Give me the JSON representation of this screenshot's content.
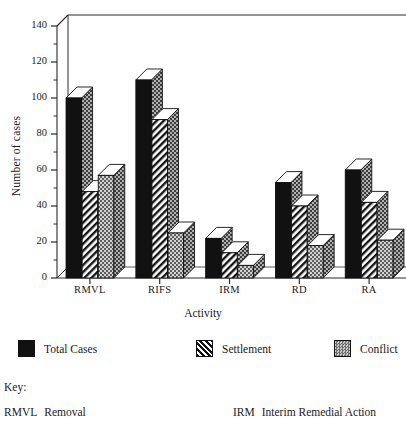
{
  "chart_data": {
    "type": "bar",
    "title": "",
    "xlabel": "Activity",
    "ylabel": "Number of cases",
    "categories": [
      "RMVL",
      "RIFS",
      "IRM",
      "RD",
      "RA"
    ],
    "series": [
      {
        "name": "Total Cases",
        "values": [
          100,
          110,
          22,
          53,
          60
        ],
        "pattern": "solid-black",
        "color": "#111111"
      },
      {
        "name": "Settlement",
        "values": [
          48,
          88,
          14,
          40,
          42
        ],
        "pattern": "diagonal-hatch",
        "color": "#111111"
      },
      {
        "name": "Conflict",
        "values": [
          57,
          25,
          7,
          18,
          21
        ],
        "pattern": "checker-gray",
        "color": "#9a9a9a"
      }
    ],
    "ylim": [
      0,
      140
    ],
    "yticks": [
      0,
      20,
      40,
      60,
      80,
      100,
      120,
      140
    ],
    "ytick_labels": [
      "0",
      "20",
      "40",
      "60",
      "80",
      "100",
      "120",
      "140"
    ],
    "minor_ticks": true,
    "grid": false,
    "legend_position": "below-axes",
    "style": "3d-isometric-bars"
  },
  "legend": {
    "items": [
      {
        "label": "Total Cases",
        "swatch": "sw-total"
      },
      {
        "label": "Settlement",
        "swatch": "sw-settle"
      },
      {
        "label": "Conflict",
        "swatch": "sw-conflict"
      }
    ]
  },
  "key": {
    "title": "Key:",
    "entries": [
      {
        "abbr": "RMVL",
        "text": "Removal"
      },
      {
        "abbr": "IRM",
        "text": "Interim Remedial Action"
      }
    ]
  }
}
